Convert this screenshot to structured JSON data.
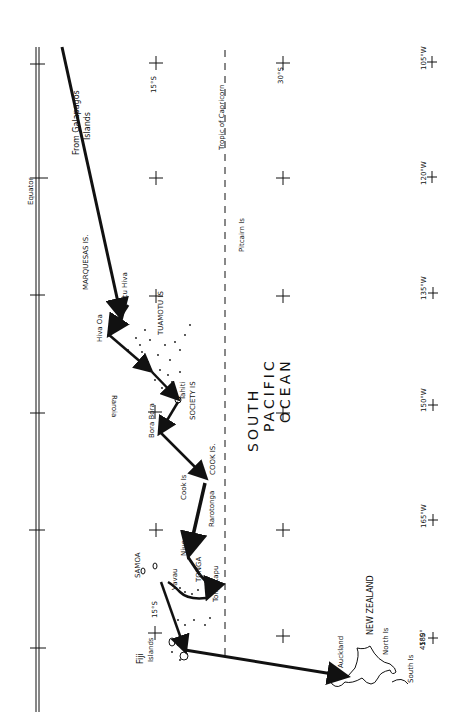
{
  "map": {
    "title": "South Pacific voyage route (hand-drawn)",
    "ocean_label": [
      "SOUTH",
      "PACIFIC",
      "OCEAN"
    ],
    "reference_lines": {
      "equator": "Equator",
      "tropic": "Tropic of Capricorn"
    },
    "latitude_labels": {
      "lat15": "15°S",
      "lat30": "30°S",
      "lat15_left": "15°S",
      "lat45": "45°S"
    },
    "longitude_labels": [
      "105°W",
      "120°W",
      "135°W",
      "150°W",
      "165°W",
      "180°"
    ],
    "places": {
      "galapagos": "From Galapagos",
      "galapagos2": "Islands",
      "marquesas": "MARQUESAS IS.",
      "fatu_hiva": "Fatu Hiva",
      "hiva_oa": "Hiva Oa",
      "tuamotu": "TUAMOTU IS",
      "raroia": "Raroia",
      "tahiti": "Tahiti",
      "society": "SOCIETY IS",
      "bora_bora": "Bora Bora",
      "cook_is": "Cook Is",
      "cook_is2": "COOK IS.",
      "rarotonga": "Rarotonga",
      "pitcairn": "Pitcairn Is",
      "samoa": "SAMOA",
      "niue": "Niue",
      "vavau": "Vavau",
      "tonga": "TONGA",
      "tongatapu": "Tongatapu",
      "fiji": "Fiji",
      "fiji2": "Islands",
      "new_zealand": "NEW ZEALAND",
      "north_is": "North Is",
      "south_is": "South Is",
      "auckland": "Auckland"
    },
    "colors": {
      "ink": "#111111",
      "paper": "#ffffff"
    }
  }
}
